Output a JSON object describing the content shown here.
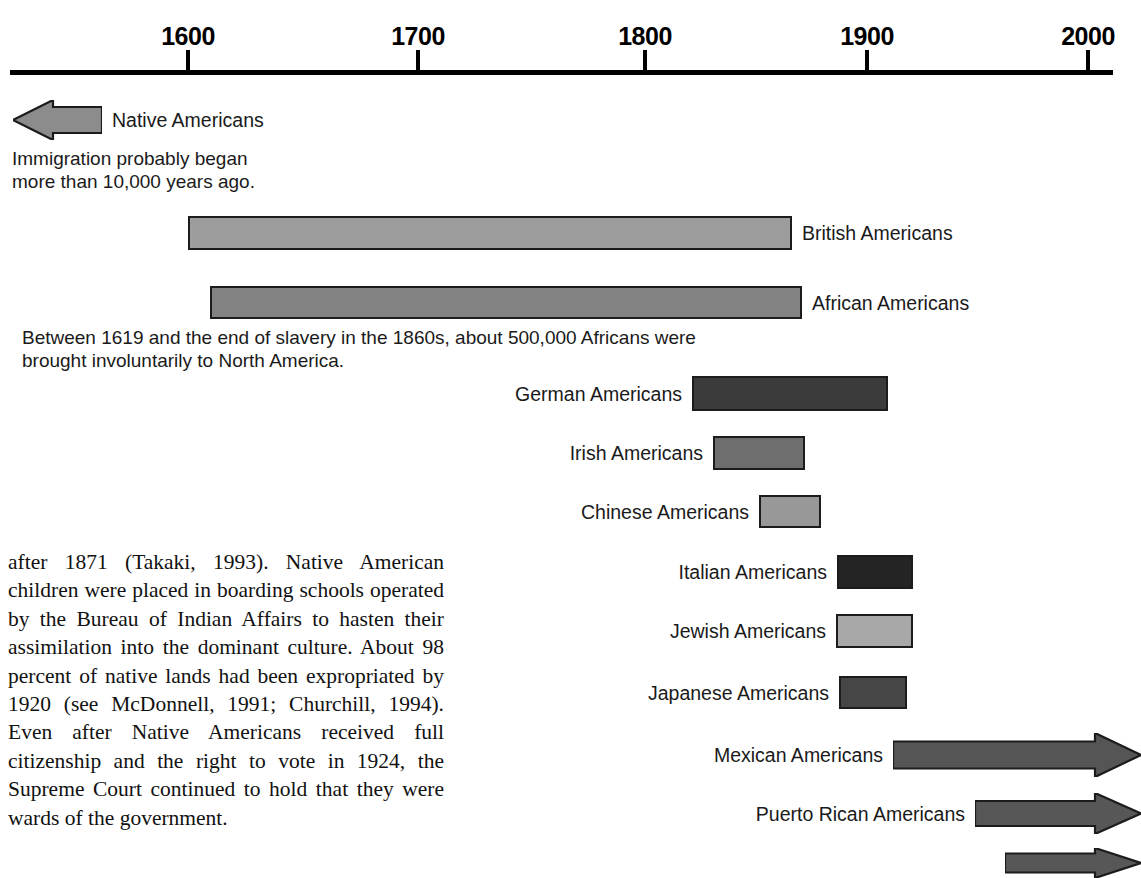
{
  "axis": {
    "ticks": [
      {
        "label": "1600",
        "x": 188
      },
      {
        "label": "1700",
        "x": 418
      },
      {
        "label": "1800",
        "x": 645
      },
      {
        "label": "1900",
        "x": 867
      },
      {
        "label": "2000",
        "x": 1088
      }
    ],
    "range_start": 1500,
    "range_end": 2000
  },
  "groups": [
    {
      "name": "Native Americans",
      "label": "Native Americans",
      "label_align": "left",
      "shape": "arrow-left",
      "color": "#8c8c8c",
      "note": "Immigration probably began\nmore than 10,000 years ago.",
      "note_line1": "Immigration probably began",
      "note_line2": "more than 10,000 years ago.",
      "x1": 13,
      "x2": 102,
      "y": 100,
      "h": 40
    },
    {
      "name": "British Americans",
      "label": "British Americans",
      "label_align": "left",
      "shape": "bar",
      "color": "#9d9d9d",
      "x1": 188,
      "x2": 792,
      "y": 216,
      "h": 34
    },
    {
      "name": "African Americans",
      "label": "African Americans",
      "label_align": "left",
      "shape": "bar",
      "color": "#828282",
      "note_line1": "Between 1619 and the end of slavery in the 1860s, about 500,000 Africans were",
      "note_line2": "brought involuntarily to North America.",
      "x1": 210,
      "x2": 802,
      "y": 286,
      "h": 33
    },
    {
      "name": "German Americans",
      "label": "German Americans",
      "label_align": "right",
      "shape": "bar",
      "color": "#3b3b3b",
      "x1": 692,
      "x2": 888,
      "y": 376,
      "h": 35
    },
    {
      "name": "Irish Americans",
      "label": "Irish Americans",
      "label_align": "right",
      "shape": "bar",
      "color": "#6e6e6e",
      "x1": 713,
      "x2": 805,
      "y": 436,
      "h": 34
    },
    {
      "name": "Chinese Americans",
      "label": "Chinese Americans",
      "label_align": "right",
      "shape": "bar",
      "color": "#989898",
      "x1": 759,
      "x2": 821,
      "y": 495,
      "h": 33
    },
    {
      "name": "Italian Americans",
      "label": "Italian Americans",
      "label_align": "right",
      "shape": "bar",
      "color": "#242424",
      "x1": 837,
      "x2": 913,
      "y": 555,
      "h": 34
    },
    {
      "name": "Jewish Americans",
      "label": "Jewish Americans",
      "label_align": "right",
      "shape": "bar",
      "color": "#a8a8a8",
      "x1": 836,
      "x2": 913,
      "y": 614,
      "h": 34
    },
    {
      "name": "Japanese Americans",
      "label": "Japanese Americans",
      "label_align": "right",
      "shape": "bar",
      "color": "#464646",
      "x1": 839,
      "x2": 907,
      "y": 676,
      "h": 33
    },
    {
      "name": "Mexican Americans",
      "label": "Mexican Americans",
      "label_align": "right",
      "shape": "arrow-right",
      "color": "#555555",
      "x1": 893,
      "x2": 1141,
      "y": 733,
      "h": 44
    },
    {
      "name": "Puerto Rican Americans",
      "label": "Puerto Rican Americans",
      "label_align": "right",
      "shape": "arrow-right",
      "color": "#575757",
      "x1": 975,
      "x2": 1141,
      "y": 793,
      "h": 41
    },
    {
      "name": "Unlabeled Americans",
      "label": "",
      "label_align": "right",
      "shape": "arrow-right",
      "color": "#575757",
      "x1": 1005,
      "x2": 1141,
      "y": 848,
      "h": 30
    }
  ],
  "body_text": {
    "paragraph": "after 1871 (Takaki, 1993). Native American children were placed in boarding schools operated by the Bureau of Indian Affairs to hasten their assimilation into the dominant culture. About 98 percent of native lands had been expropriated by 1920 (see McDonnell, 1991; Churchill, 1994). Even after Native Americans received full citizenship and the right to vote in 1924, the Supreme Court continued to hold that they were wards of the government."
  }
}
